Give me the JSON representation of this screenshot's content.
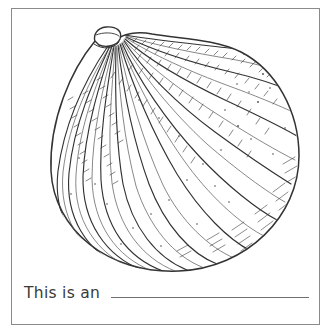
{
  "page": {
    "background_color": "#ffffff",
    "border_color": "#8a8a8a"
  },
  "illustration": {
    "name": "onion-line-drawing",
    "subject": "onion",
    "style": "black and white pen-and-ink engraving / coloring page outline",
    "ink_color": "#333333",
    "fill_color": "#ffffff",
    "description": "A whole unpeeled onion shown from the side with a dry papery neck at the top and radiating vertical ridge lines with fine hatching over the skin"
  },
  "caption": {
    "prompt_text": "This is an",
    "answer_value": "",
    "answer_placeholder": "",
    "line_color": "#6f6f6f"
  }
}
